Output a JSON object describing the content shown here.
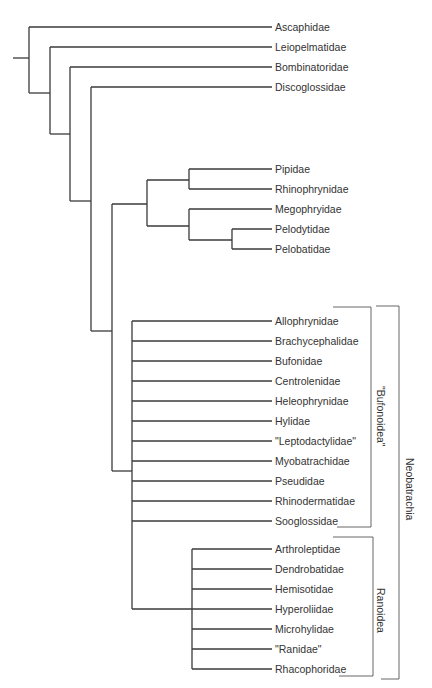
{
  "figure": {
    "type": "phylogenetic-tree"
  },
  "tips": [
    {
      "label": "Ascaphidae",
      "y": 27
    },
    {
      "label": "Leiopelmatidae",
      "y": 47
    },
    {
      "label": "Bombinatoridae",
      "y": 67
    },
    {
      "label": "Discoglossidae",
      "y": 87
    },
    {
      "label": "Pipidae",
      "y": 169
    },
    {
      "label": "Rhinophrynidae",
      "y": 189
    },
    {
      "label": "Megophryidae",
      "y": 209
    },
    {
      "label": "Pelodytidae",
      "y": 229
    },
    {
      "label": "Pelobatidae",
      "y": 249
    },
    {
      "label": "Allophrynidae",
      "y": 321
    },
    {
      "label": "Brachycephalidae",
      "y": 341
    },
    {
      "label": "Bufonidae",
      "y": 361
    },
    {
      "label": "Centrolenidae",
      "y": 381
    },
    {
      "label": "Heleophrynidae",
      "y": 401
    },
    {
      "label": "Hylidae",
      "y": 421
    },
    {
      "label": "\"Leptodactylidae\"",
      "y": 441
    },
    {
      "label": "Myobatrachidae",
      "y": 461
    },
    {
      "label": "Pseudidae",
      "y": 481
    },
    {
      "label": "Rhinodermatidae",
      "y": 501
    },
    {
      "label": "Sooglossidae",
      "y": 521
    },
    {
      "label": "Arthroleptidae",
      "y": 549
    },
    {
      "label": "Dendrobatidae",
      "y": 569
    },
    {
      "label": "Hemisotidae",
      "y": 589
    },
    {
      "label": "Hyperoliidae",
      "y": 609
    },
    {
      "label": "Microhylidae",
      "y": 629
    },
    {
      "label": "\"Ranidae\"",
      "y": 649
    },
    {
      "label": "Rhacophoridae",
      "y": 669
    }
  ],
  "clades": {
    "bufonoidea": {
      "label": "\"Bufonoidea\"",
      "members": [
        "Allophrynidae",
        "Brachycephalidae",
        "Bufonidae",
        "Centrolenidae",
        "Heleophrynidae",
        "Hylidae",
        "\"Leptodactylidae\"",
        "Myobatrachidae",
        "Pseudidae",
        "Rhinodermatidae",
        "Sooglossidae"
      ]
    },
    "ranoidea": {
      "label": "Ranoidea",
      "members": [
        "Arthroleptidae",
        "Dendrobatidae",
        "Hemisotidae",
        "Hyperoliidae",
        "Microhylidae",
        "\"Ranidae\"",
        "Rhacophoridae"
      ]
    },
    "neobatrachia": {
      "label": "Neobatrachia",
      "members": [
        "\"Bufonoidea\"",
        "Ranoidea"
      ]
    }
  },
  "colors": {
    "branch": "#3a3a3a",
    "bracket": "#555555",
    "text": "#333333",
    "background": "#ffffff"
  }
}
